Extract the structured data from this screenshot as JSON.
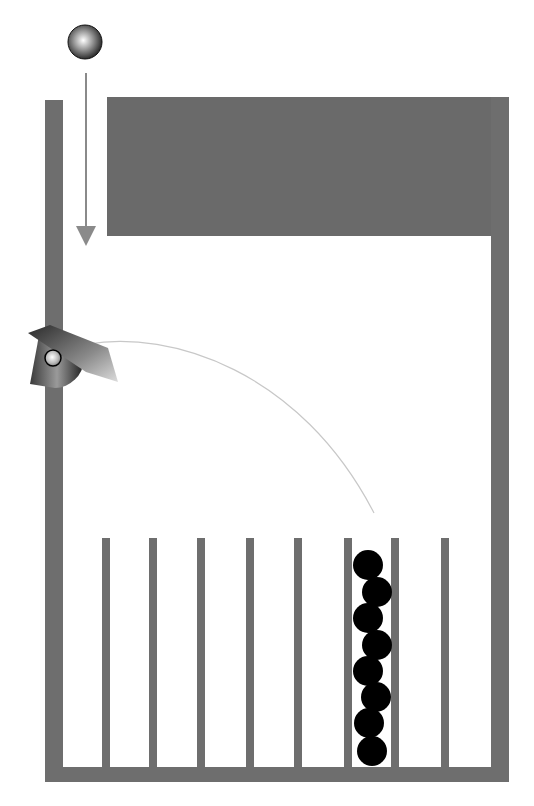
{
  "diagram": {
    "canvas": {
      "width": 534,
      "height": 806,
      "background": "#ffffff"
    },
    "colors": {
      "wall": "#6e6e6e",
      "block": "#6a6a6a",
      "ball_stack": "#000000",
      "arrow": "#8a8a8a",
      "trajectory": "#c8c8c8",
      "launcher_dark": "#2e2e2e",
      "launcher_light": "#d0d0d0"
    },
    "falling_ball": {
      "cx": 85,
      "cy": 42,
      "r": 17
    },
    "drop_arrow": {
      "x": 86,
      "y1": 73,
      "y2": 242
    },
    "container": {
      "left_wall": {
        "x": 45,
        "y": 100,
        "w": 18,
        "h": 682
      },
      "right_wall": {
        "x": 491,
        "y": 97,
        "w": 18,
        "h": 685
      },
      "floor": {
        "x": 45,
        "y": 767,
        "w": 464,
        "h": 15
      },
      "top_block": {
        "x": 107,
        "y": 97,
        "w": 402,
        "h": 139
      }
    },
    "dividers": {
      "top": 538,
      "bottom": 767,
      "width": 8,
      "x_positions": [
        102,
        149,
        197,
        246,
        294,
        344,
        391,
        441
      ]
    },
    "launcher": {
      "pivot": {
        "cx": 53,
        "cy": 358
      },
      "ball": {
        "cx": 53,
        "cy": 358,
        "r": 8
      }
    },
    "trajectory": {
      "path": "M 88 344 C 170 330, 300 370, 374 513"
    },
    "stacked_balls": {
      "count": 8,
      "r": 15,
      "positions": [
        {
          "cx": 368,
          "cy": 565
        },
        {
          "cx": 377,
          "cy": 592
        },
        {
          "cx": 368,
          "cy": 618
        },
        {
          "cx": 377,
          "cy": 645
        },
        {
          "cx": 368,
          "cy": 671
        },
        {
          "cx": 376,
          "cy": 697
        },
        {
          "cx": 369,
          "cy": 723
        },
        {
          "cx": 372,
          "cy": 751
        }
      ]
    },
    "bin_count": 9,
    "filled_bin_index": 6
  }
}
